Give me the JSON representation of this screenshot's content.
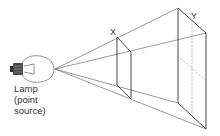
{
  "diagram": {
    "lamp_label_lines": [
      "Lamp",
      "(point",
      "source)"
    ],
    "plane_x_label": "X",
    "plane_y_label": "Y",
    "colors": {
      "line": "#444444",
      "dashed": "#888888",
      "bulb": "#555555",
      "base": "#333333"
    },
    "source_point": [
      55,
      69
    ],
    "plane_x": {
      "tl": [
        117,
        37
      ],
      "tr": [
        131,
        52
      ],
      "bl": [
        117,
        85
      ],
      "br": [
        131,
        99
      ]
    },
    "plane_y": {
      "tl": [
        178,
        8
      ],
      "tr": [
        206,
        33
      ],
      "bl": [
        178,
        103
      ],
      "br": [
        206,
        129
      ]
    }
  }
}
